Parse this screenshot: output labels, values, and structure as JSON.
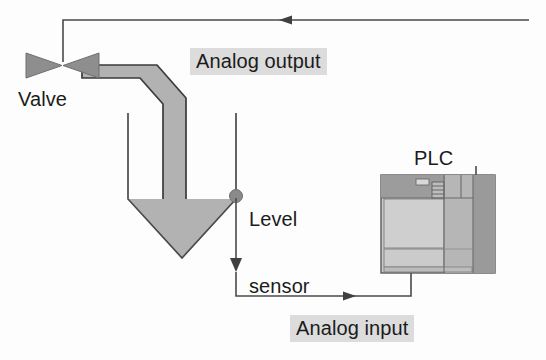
{
  "diagram": {
    "labels": {
      "valve": "Valve",
      "plc": "PLC",
      "level_sensor_line1": "Level",
      "level_sensor_line2": "sensor",
      "analog_output": "Analog output",
      "analog_input": "Analog input"
    },
    "icons": {
      "valve": "valve-bowtie-icon",
      "sensor": "level-sensor-dot-icon",
      "tank": "conical-tank-icon",
      "pipe": "pipe-icon",
      "plc": "plc-module-icon",
      "arrow_output": "arrow-left-icon",
      "arrow_input": "arrow-right-icon",
      "arrow_sensor": "arrow-down-icon"
    },
    "colors": {
      "line": "#4a4a4a",
      "fill_material": "#b2b2b2",
      "pipe": "#b2b2b2",
      "valve": "#8e8e8e",
      "sensor_dot": "#8a8a8a",
      "label_highlight": "#dcdcdc",
      "text": "#1b1b1b",
      "plc_body": "#c9c9c9",
      "plc_top_band": "#9c9c9c",
      "plc_right_panel": "#b6b6b6",
      "plc_far_right_panel": "#9a9a9a",
      "background": "#fdfdfd"
    },
    "signals": [
      {
        "name": "analog-output",
        "from": "PLC",
        "to": "Valve",
        "direction": "left"
      },
      {
        "name": "analog-input",
        "from": "Level sensor",
        "to": "PLC",
        "direction": "right"
      }
    ]
  }
}
